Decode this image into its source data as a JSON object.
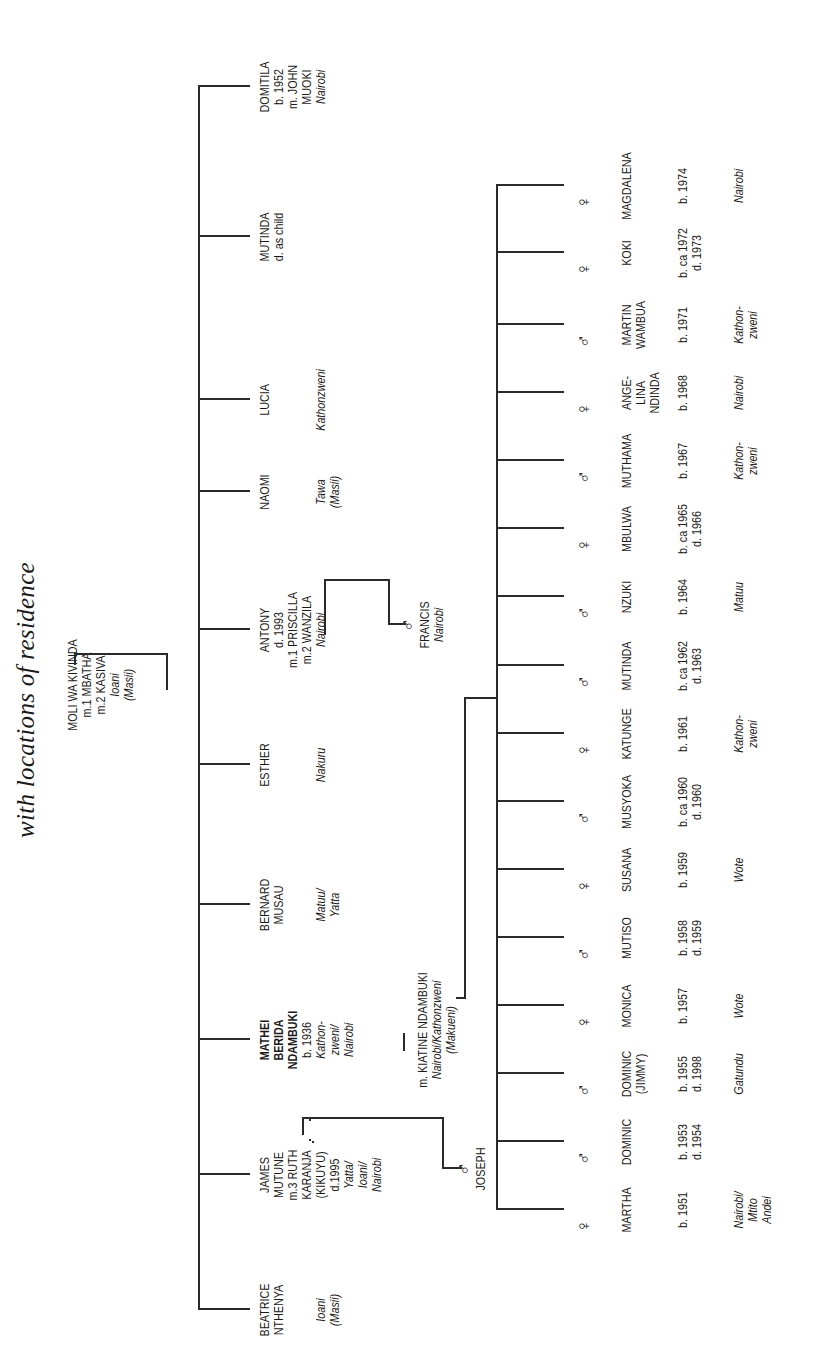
{
  "title": "with locations of residence",
  "ancestor": {
    "name": "MOLI WA KIVINDA",
    "marriages": [
      "m.1 MBATHA",
      "m.2 KASIVA"
    ],
    "location": "Ioani\n(Masii)"
  },
  "siblings": [
    {
      "name": "BEATRICE\nNTHENYA",
      "detail": "",
      "location": "Ioani\n(Masii)"
    },
    {
      "name": "JAMES\nMUTUNE",
      "detail": "m.3 RUTH\nKARANJA\n(KIKUYU)\nd.1995",
      "location": "Yatta/\nIoani/\nNairobi"
    },
    {
      "name": "MATHEI\nBERIDA\nNDAMBUKI",
      "detail": "b. 1936",
      "location": "Kathon-\nzweni/\nNairobi",
      "bold": true
    },
    {
      "name": "BERNARD\nMUSAU",
      "detail": "",
      "location": "Matuu/\nYatta"
    },
    {
      "name": "ESTHER",
      "detail": "",
      "location": "Nakuru"
    },
    {
      "name": "ANTONY",
      "detail": "d. 1993\nm.1 PRISCILLA\nm.2 WANZILA",
      "location": "Nairobi"
    },
    {
      "name": "NAOMI",
      "detail": "",
      "location": "Tawa\n(Masii)"
    },
    {
      "name": "LUCIA",
      "detail": "",
      "location": "Kathonzweni"
    },
    {
      "name": "MUTINDA",
      "detail": "d. as child",
      "location": ""
    },
    {
      "name": "DOMITILA",
      "detail": "b. 1952\nm. JOHN\nMUOKI",
      "location": "Nairobi"
    }
  ],
  "james_child": {
    "symbol": "♂",
    "name": "JOSEPH"
  },
  "antony_child": {
    "symbol": "♂",
    "name": "FRANCIS",
    "location": "Nairobi"
  },
  "mathei_spouse": {
    "name": "m. KIATINE NDAMBUKI",
    "location": "Nairobi/Kathonzweni\n(Makueni)"
  },
  "children": [
    {
      "symbol": "♀",
      "name": "MARTHA",
      "dates": "b. 1951",
      "location": "Nairobi/\nMtito\nAndei"
    },
    {
      "symbol": "♂",
      "name": "DOMINIC",
      "dates": "b. 1953\nd. 1954",
      "location": ""
    },
    {
      "symbol": "♂",
      "name": "DOMINIC\n(JIMMY)",
      "dates": "b. 1955\nd. 1998",
      "location": "Gatundu"
    },
    {
      "symbol": "♀",
      "name": "MONICA",
      "dates": "b. 1957",
      "location": "Wote"
    },
    {
      "symbol": "♂",
      "name": "MUTISO",
      "dates": "b. 1958\nd. 1959",
      "location": ""
    },
    {
      "symbol": "♀",
      "name": "SUSANA",
      "dates": "b. 1959",
      "location": "Wote"
    },
    {
      "symbol": "♂",
      "name": "MUSYOKA",
      "dates": "b. ca 1960\nd. 1960",
      "location": ""
    },
    {
      "symbol": "♀",
      "name": "KATUNGE",
      "dates": "b. 1961",
      "location": "Kathon-\nzweni"
    },
    {
      "symbol": "♂",
      "name": "MUTINDA",
      "dates": "b. ca 1962\nd. 1963",
      "location": ""
    },
    {
      "symbol": "♂",
      "name": "NZUKI",
      "dates": "b. 1964",
      "location": "Matuu"
    },
    {
      "symbol": "♀",
      "name": "MBULWA",
      "dates": "b. ca 1965\nd. 1966",
      "location": ""
    },
    {
      "symbol": "♂",
      "name": "MUTHAMA",
      "dates": "b. 1967",
      "location": "Kathon-\nzweni"
    },
    {
      "symbol": "♀",
      "name": "ANGE-\nLINA\nNDINDA",
      "dates": "b. 1968",
      "location": "Nairobi"
    },
    {
      "symbol": "♂",
      "name": "MARTIN\nWAMBUA",
      "dates": "b. 1971",
      "location": "Kathon-\nzweni"
    },
    {
      "symbol": "♀",
      "name": "KOKI",
      "dates": "b. ca 1972\nd. 1973",
      "location": ""
    },
    {
      "symbol": "♀",
      "name": "MAGDALENA",
      "dates": "b. 1974",
      "location": "Nairobi"
    }
  ],
  "colors": {
    "line": "#2a2a2a",
    "text": "#1a1a1a",
    "background": "#ffffff"
  }
}
